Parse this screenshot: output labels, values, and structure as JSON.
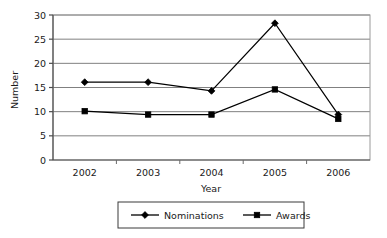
{
  "chart_data": {
    "type": "line",
    "title": "",
    "xlabel": "Year",
    "ylabel": "Number",
    "categories": [
      "2002",
      "2003",
      "2004",
      "2005",
      "2006"
    ],
    "series": [
      {
        "name": "Nominations",
        "marker": "diamond",
        "color": "#000000",
        "values": [
          16.1,
          16.1,
          14.3,
          28.3,
          9.4
        ]
      },
      {
        "name": "Awards",
        "marker": "square",
        "color": "#000000",
        "values": [
          10.1,
          9.4,
          9.4,
          14.6,
          8.5
        ]
      }
    ],
    "ylim": [
      0,
      30
    ],
    "yticks": [
      "0",
      "5",
      "10",
      "15",
      "20",
      "25",
      "30"
    ],
    "ytick_values": [
      0,
      5,
      10,
      15,
      20,
      25,
      30
    ],
    "grid": "horizontal",
    "grid_color": "#808080",
    "legend_position": "bottom",
    "plot_border": "#808080",
    "background": "#ffffff"
  },
  "legend": {
    "entries": [
      {
        "label": "Nominations",
        "marker": "diamond-marker-icon"
      },
      {
        "label": "Awards",
        "marker": "square-marker-icon"
      }
    ]
  }
}
